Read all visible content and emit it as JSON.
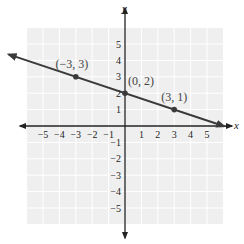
{
  "chart_data": {
    "type": "line",
    "title": "",
    "xlabel": "x",
    "ylabel": "y",
    "xlim": [
      -6,
      6
    ],
    "ylim": [
      -6,
      6
    ],
    "grid": true,
    "x_ticks": [
      -5,
      -4,
      -3,
      -2,
      -1,
      1,
      2,
      3,
      4,
      5
    ],
    "y_ticks": [
      5,
      4,
      3,
      2,
      1,
      -1,
      -2,
      -3,
      -4,
      -5
    ],
    "x_tick_labels": [
      "−5",
      "−4",
      "−3",
      "−2",
      "−1",
      "1",
      "2",
      "3",
      "4",
      "5"
    ],
    "y_tick_labels": [
      "5",
      "4",
      "3",
      "2",
      "1",
      "−1",
      "−2",
      "−3",
      "−4",
      "−5"
    ],
    "series": [
      {
        "name": "line",
        "equation": "y = -x/3 + 2",
        "slope": -0.3333,
        "intercept": 2,
        "arrows": "both",
        "color": "#3a3a3a"
      }
    ],
    "points": [
      {
        "x": -3,
        "y": 3,
        "label": "(−3, 3)"
      },
      {
        "x": 0,
        "y": 2,
        "label": "(0, 2)"
      },
      {
        "x": 3,
        "y": 1,
        "label": "(3, 1)"
      }
    ]
  },
  "style": {
    "grid_bg": "#efefef",
    "grid_line": "#ffffff",
    "axis_color": "#222222",
    "line_color": "#3a3a3a",
    "point_color": "#3a3a3a"
  }
}
